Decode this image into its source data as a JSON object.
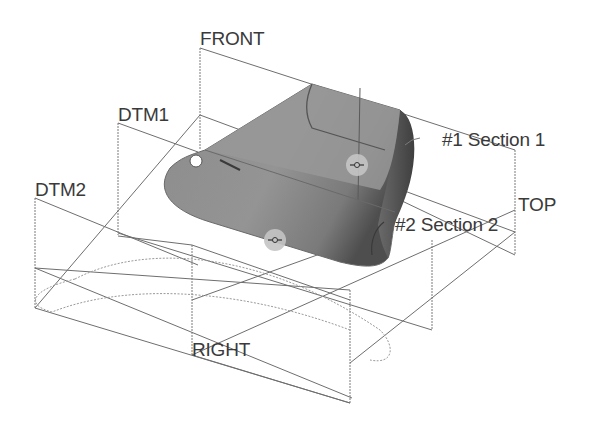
{
  "viewport": {
    "background": "#ffffff",
    "model_type": "swept blend",
    "colors": {
      "datum_line": "#6e6e6e",
      "trajectory": "#9a9a9a",
      "solid_fill": "#8a8a8a",
      "solid_dark": "#555555",
      "handle": "#c8c8c8",
      "label": "#3a3a3a"
    }
  },
  "datum_planes": [
    {
      "id": "front",
      "label": "FRONT"
    },
    {
      "id": "dtm1",
      "label": "DTM1"
    },
    {
      "id": "dtm2",
      "label": "DTM2"
    },
    {
      "id": "top",
      "label": "TOP"
    },
    {
      "id": "right",
      "label": "RIGHT"
    }
  ],
  "sections": [
    {
      "id": "section1",
      "label": "#1 Section 1"
    },
    {
      "id": "section2",
      "label": "#2 Section 2"
    }
  ],
  "icons": {
    "start_point": "start-point-icon",
    "drag_handle": "drag-handle-icon"
  }
}
